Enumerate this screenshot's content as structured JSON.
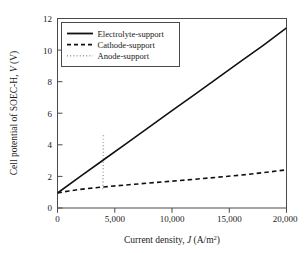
{
  "chart_data": {
    "type": "line",
    "title": "",
    "xlabel": "Current density, J (A/m²)",
    "xlabel_parts": {
      "pre": "Current density, ",
      "symbol": "J",
      "post": " (A/m",
      "sup": "2",
      "tail": ")"
    },
    "ylabel": "Cell potential of SOEC-H, V (V)",
    "ylabel_parts": {
      "pre": "Cell potential of SOEC-H, ",
      "symbol": "V",
      "post": " (V)"
    },
    "xlim": [
      0,
      20000
    ],
    "ylim": [
      0,
      12
    ],
    "xticks": [
      0,
      5000,
      10000,
      15000,
      20000
    ],
    "xtick_labels": [
      "0",
      "5,000",
      "10,000",
      "15,000",
      "20,000"
    ],
    "yticks": [
      0,
      2,
      4,
      6,
      8,
      10,
      12
    ],
    "ytick_labels": [
      "0",
      "2",
      "4",
      "6",
      "8",
      "10",
      "12"
    ],
    "grid": false,
    "legend_position": "upper left",
    "series": [
      {
        "name": "Electrolyte-support",
        "style": "solid",
        "color": "#111111",
        "x": [
          0,
          2000,
          4000,
          6000,
          8000,
          10000,
          12000,
          14000,
          16000,
          18000,
          20000
        ],
        "values": [
          0.95,
          2.0,
          3.04,
          4.08,
          5.12,
          6.16,
          7.2,
          8.24,
          9.28,
          10.32,
          11.4
        ]
      },
      {
        "name": "Cathode-support",
        "style": "dashed",
        "color": "#111111",
        "x": [
          0,
          1000,
          2000,
          3000,
          4000,
          6000,
          8000,
          10000,
          12000,
          14000,
          16000,
          18000,
          20000
        ],
        "values": [
          0.95,
          1.08,
          1.18,
          1.26,
          1.33,
          1.46,
          1.58,
          1.7,
          1.82,
          1.95,
          2.08,
          2.24,
          2.42
        ]
      },
      {
        "name": "Anode-support",
        "style": "dotted",
        "color": "#9a9a9a",
        "x": [
          3950,
          3990,
          4000,
          4005,
          4010
        ],
        "values": [
          1.2,
          2.2,
          3.2,
          4.0,
          4.6
        ]
      }
    ]
  },
  "legend": {
    "entries": [
      {
        "label": "Electrolyte-support"
      },
      {
        "label": "Cathode-support"
      },
      {
        "label": "Anode-support"
      }
    ]
  }
}
